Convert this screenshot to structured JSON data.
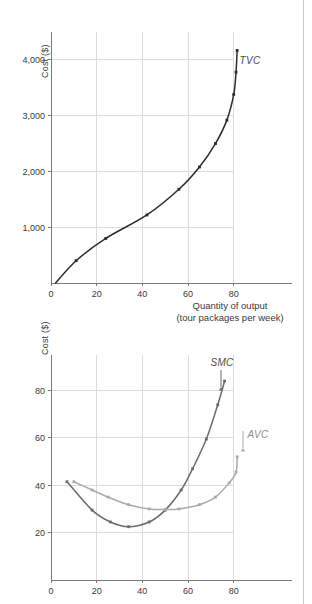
{
  "figure": {
    "panels": [
      {
        "id": "tvc",
        "axis": {
          "ylabel": "Cost ($)",
          "xlabel_line1": "Quantity of output",
          "xlabel_line2": "(tour packages per week)",
          "yticks": [
            "1,000",
            "2,000",
            "3,000",
            "4,000"
          ],
          "xticks": [
            "0",
            "20",
            "40",
            "60",
            "80"
          ]
        },
        "series_label": "TVC"
      },
      {
        "id": "smc-avc",
        "axis": {
          "ylabel": "Cost ($)",
          "yticks": [
            "20",
            "40",
            "60",
            "80"
          ],
          "xticks": [
            "0",
            "20",
            "40",
            "60",
            "80"
          ]
        },
        "series_label_1": "SMC",
        "series_label_2": "AVC"
      }
    ]
  },
  "colors": {
    "curve_dark": "#2b2b2b",
    "curve_mid": "#6b6b6b",
    "curve_gray": "#aaaaaa",
    "grid": "#dcdcdc",
    "axis": "#7a7a7a",
    "text": "#3a3a3a",
    "rule": "#c9c9c9"
  },
  "chart_data": [
    {
      "type": "line",
      "id": "tvc",
      "title": "",
      "xlabel": "Quantity of output (tour packages per week)",
      "ylabel": "Cost ($)",
      "xlim": [
        0,
        95
      ],
      "ylim": [
        0,
        4500
      ],
      "xticks": [
        0,
        20,
        40,
        60,
        80
      ],
      "yticks": [
        1000,
        2000,
        3000,
        4000
      ],
      "grid": true,
      "legend": "inline-label",
      "series": [
        {
          "name": "TVC",
          "x": [
            2,
            11,
            24,
            42,
            56,
            65,
            72,
            77,
            80,
            81,
            81.5
          ],
          "y": [
            0,
            400,
            800,
            1220,
            1680,
            2080,
            2500,
            2920,
            3380,
            3780,
            4170
          ]
        }
      ]
    },
    {
      "type": "line",
      "id": "smc-avc",
      "title": "",
      "xlabel": "",
      "ylabel": "Cost ($)",
      "xlim": [
        0,
        95
      ],
      "ylim": [
        0,
        95
      ],
      "xticks": [
        0,
        20,
        40,
        60,
        80
      ],
      "yticks": [
        20,
        40,
        60,
        80
      ],
      "grid": true,
      "legend": "inline-label",
      "series": [
        {
          "name": "SMC",
          "x": [
            7,
            18,
            26,
            34,
            43,
            50,
            57,
            62,
            68,
            73,
            76
          ],
          "y": [
            41.5,
            29.5,
            24.5,
            22.5,
            24.5,
            29.5,
            38.0,
            47.0,
            59.5,
            74.0,
            84.0
          ]
        },
        {
          "name": "AVC",
          "x": [
            10,
            18,
            25,
            34,
            43,
            50,
            56,
            65,
            72,
            78,
            81,
            81.5
          ],
          "y": [
            41.5,
            38.0,
            35.0,
            31.8,
            30.0,
            29.8,
            30.0,
            31.8,
            35.0,
            41.0,
            45.5,
            52.0
          ]
        }
      ]
    }
  ]
}
